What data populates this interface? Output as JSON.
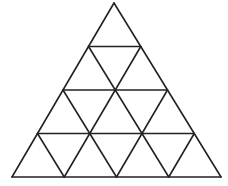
{
  "diagram": {
    "type": "triangular-grid",
    "rows": 4,
    "stroke_color": "#222222",
    "background_color": "#ffffff",
    "stroke_width": 1.6,
    "apex": [
      114,
      3
    ],
    "base_y": 177,
    "base_left_x": 12,
    "base_right_x": 221
  }
}
